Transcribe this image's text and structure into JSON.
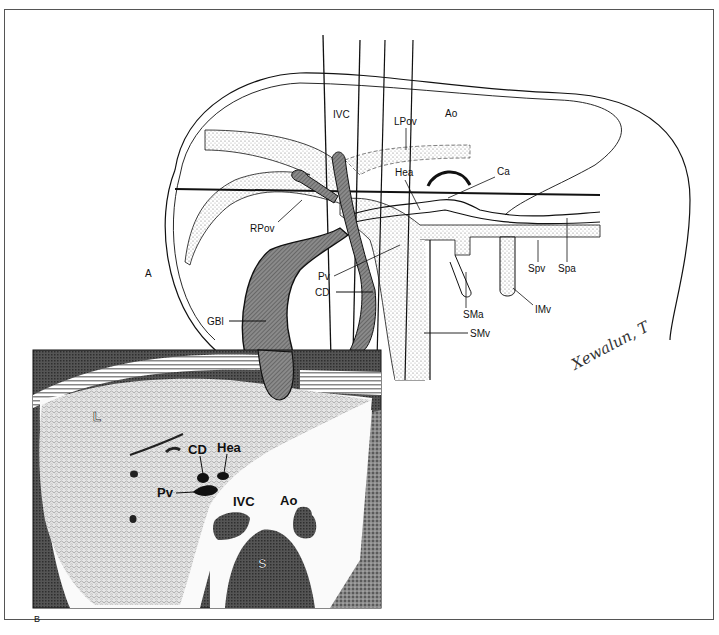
{
  "figure": {
    "panels": [
      {
        "id": "A",
        "label": "A",
        "type": "schematic-drawing"
      },
      {
        "id": "B",
        "label": "B",
        "type": "ct-scan-axial"
      }
    ],
    "panel_a": {
      "labels": {
        "ivc": "IVC",
        "lpov": "LPov",
        "ao": "Ao",
        "hea": "Hea",
        "ca": "Ca",
        "rpov": "RPov",
        "pv": "Pv",
        "cd": "CD",
        "gbl": "GBl",
        "spv": "Spv",
        "spa": "Spa",
        "sma": "SMa",
        "imv": "IMv",
        "smv": "SMv"
      },
      "signature": "Xewalun, T"
    },
    "panel_b": {
      "labels": {
        "l": "L",
        "cd": "CD",
        "hea": "Hea",
        "pv": "Pv",
        "ivc": "IVC",
        "ao": "Ao",
        "s": "S"
      }
    },
    "colors": {
      "ink": "#111111",
      "stipple": "#cfcfcf",
      "hatch": "#6a6a6a",
      "ct_dark": "#4a4a4a",
      "ct_mid": "#9a9a9a",
      "ct_liver": "#d4d4d4",
      "background": "#ffffff"
    }
  }
}
